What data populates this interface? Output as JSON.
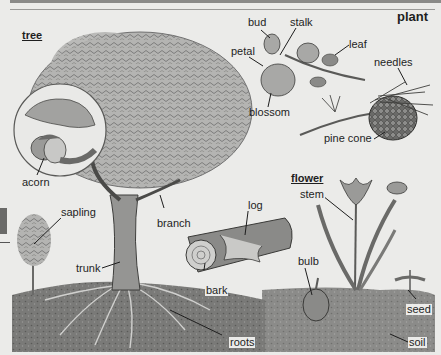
{
  "page": {
    "title": "plant",
    "colors": {
      "background": "#ebebe9",
      "ink": "#1e1e1e",
      "foliage": "#8f8f8d",
      "soil": "#6e6e6c"
    }
  },
  "sections": {
    "tree": {
      "heading": "tree",
      "labels": {
        "acorn": "acorn",
        "sapling": "sapling",
        "branch": "branch",
        "trunk": "trunk",
        "roots": "roots",
        "log": "log",
        "bark": "bark"
      }
    },
    "plant_parts": {
      "labels": {
        "bud": "bud",
        "stalk": "stalk",
        "leaf": "leaf",
        "petal": "petal",
        "blossom": "blossom",
        "needles": "needles",
        "pine_cone": "pine cone"
      }
    },
    "flower": {
      "heading": "flower",
      "labels": {
        "stem": "stem",
        "bulb": "bulb",
        "seed": "seed",
        "soil": "soil"
      }
    }
  }
}
